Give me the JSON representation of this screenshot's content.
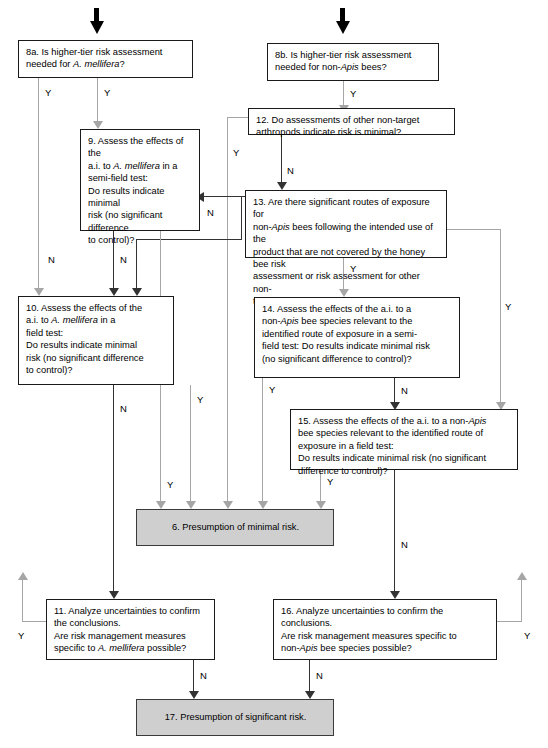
{
  "diagram": {
    "colors": {
      "box_border": "#1a1a1a",
      "box_fill": "#ffffff",
      "terminal_fill": "#cfcfcf",
      "connector_dark": "#333333",
      "connector_gray": "#a6a6a6",
      "entry_arrow": "#000000",
      "text": "#000000"
    },
    "edge_labels": {
      "yes": "Y",
      "no": "N"
    }
  },
  "nodes": {
    "n8a": {
      "id": "8a",
      "text_parts": [
        "8a. Is higher-tier risk assessment needed for ",
        "A. mellifera",
        "?"
      ],
      "plain": "8a. Is higher-tier risk assessment needed for A. mellifera?"
    },
    "n8b": {
      "id": "8b",
      "text_parts": [
        "8b. Is higher-tier risk assessment needed for non-",
        "Apis",
        " bees?"
      ],
      "plain": "8b. Is higher-tier risk assessment needed for non-Apis bees?"
    },
    "n9": {
      "id": "9",
      "text_parts": [
        "9. Assess the effects of the a.i. to ",
        "A. mellifera",
        " in a semi-field test: Do results indicate minimal risk (no significant difference to control)?"
      ],
      "plain": "9. Assess the effects of the a.i. to A. mellifera in a semi-field test: Do results indicate minimal risk (no significant difference to control)?"
    },
    "n10": {
      "id": "10",
      "text_parts": [
        "10. Assess the effects of the a.i. to ",
        "A. mellifera",
        " in a field test: Do results indicate minimal risk (no significant difference to control)?"
      ],
      "plain": "10. Assess the effects of the a.i. to A. mellifera in a field test: Do results indicate minimal risk (no significant difference to control)?"
    },
    "n11": {
      "id": "11",
      "text_parts": [
        "11. Analyze uncertainties to confirm the conclusions. Are risk management measures specific to ",
        "A. mellifera",
        " possible?"
      ],
      "plain": "11. Analyze uncertainties to confirm the conclusions. Are risk management measures specific to A. mellifera possible?"
    },
    "n12": {
      "id": "12",
      "plain": "12. Do assessments of other non-target arthropods indicate risk is minimal?"
    },
    "n13": {
      "id": "13",
      "text_parts": [
        "13. Are there significant routes of exposure for non-",
        "Apis",
        " bees following the intended use of the product that are not covered by the honey bee risk assessment or risk assessment for other non-target arthropods?"
      ],
      "plain": "13. Are there significant routes of exposure for non-Apis bees following the intended use of the product that are not covered by the honey bee risk assessment or risk assessment for other non-target arthropods?"
    },
    "n14": {
      "id": "14",
      "text_parts": [
        "14. Assess the effects of the a.i. to a non-",
        "Apis",
        " bee species relevant to the identified route of exposure in a semi-field test: Do results indicate minimal risk (no significant difference to control)?"
      ],
      "plain": "14. Assess the effects of the a.i. to a non-Apis bee species relevant to the identified route of exposure in a semi-field test: Do results indicate minimal risk (no significant difference to control)?"
    },
    "n15": {
      "id": "15",
      "text_parts": [
        "15. Assess the effects of the a.i. to a non-",
        "Apis",
        " bee species relevant to the identified route of exposure in a field test: Do results indicate minimal risk (no significant difference to control)?"
      ],
      "plain": "15. Assess the effects of the a.i. to a non-Apis bee species relevant to the identified route of exposure in a field test: Do results indicate minimal risk (no significant difference to control)?"
    },
    "n16": {
      "id": "16",
      "text_parts": [
        "16. Analyze uncertainties to confirm the conclusions. Are risk management measures specific to non-",
        "Apis",
        " bee species possible?"
      ],
      "plain": "16. Analyze uncertainties to confirm the conclusions. Are risk management measures specific to non-Apis bee species possible?"
    },
    "n6": {
      "id": "6",
      "plain": "6. Presumption of minimal risk."
    },
    "n17": {
      "id": "17",
      "plain": "17. Presumption of significant risk."
    }
  },
  "labels": {
    "y8a_left": "Y",
    "y8a_mid": "Y",
    "y8b": "Y",
    "n12": "N",
    "y12": "Y",
    "n9_a": "N",
    "n9_b": "N",
    "n13": "N",
    "y13_right": "Y",
    "y13_down": "Y",
    "n10": "N",
    "y10_right": "Y",
    "y14": "Y",
    "n14": "N",
    "y15": "Y",
    "n15": "N",
    "y6_right": "Y",
    "y6_mid": "Y",
    "n11": "N",
    "y11": "Y",
    "n16": "N",
    "y16": "Y"
  },
  "fragments": {
    "n9_l1": "9. Assess the effects of the",
    "n9_l2a": "a.i. to ",
    "n9_l2i": "A. mellifera",
    "n9_l2b": " in a",
    "n9_l3": "semi-field test:",
    "n9_l4": "Do results indicate minimal",
    "n9_l5": "risk (no significant difference",
    "n9_l6": "to control)?",
    "n10_l1": "10. Assess the effects of the",
    "n10_l2a": "a.i. to ",
    "n10_l2i": "A. mellifera",
    "n10_l2b": " in a",
    "n10_l3": "field test:",
    "n10_l4": "Do results indicate minimal",
    "n10_l5": "risk (no significant difference",
    "n10_l6": "to control)?",
    "n8a_l1": "8a. Is higher-tier risk assessment",
    "n8a_l2a": "needed for ",
    "n8a_l2i": "A. mellifera",
    "n8a_l2b": "?",
    "n8b_l1": "8b. Is higher-tier risk assessment",
    "n8b_l2a": "needed for non-",
    "n8b_l2i": "Apis",
    "n8b_l2b": " bees?",
    "n12_l1": "12. Do assessments of other non-target",
    "n12_l2": "arthropods indicate risk is minimal?",
    "n13_l1": "13. Are there significant routes of exposure for",
    "n13_l2a": "non-",
    "n13_l2i": "Apis",
    "n13_l2b": " bees following the intended use of the",
    "n13_l3": "product that are not covered by the honey bee risk",
    "n13_l4": "assessment or risk assessment for other non-",
    "n13_l5": "target arthropods?",
    "n14_l1": "14. Assess the effects of the a.i. to a",
    "n14_l2a": "non-",
    "n14_l2i": "Apis",
    "n14_l2b": " bee species relevant to the",
    "n14_l3": "identified route of exposure in a semi-",
    "n14_l4": "field test: Do results indicate minimal risk",
    "n14_l5": "(no significant difference to control)?",
    "n15_l1a": "15. Assess the effects of the a.i. to a non-",
    "n15_l1i": "Apis",
    "n15_l2": "bee species relevant to the identified route of",
    "n15_l3": "exposure in a field test:",
    "n15_l4": "Do results indicate minimal risk (no significant",
    "n15_l5": "difference to control)?",
    "n11_l1": "11. Analyze uncertainties to confirm",
    "n11_l2": "the conclusions.",
    "n11_l3": "Are risk management measures",
    "n11_l4a": "specific to ",
    "n11_l4i": "A. mellifera",
    "n11_l4b": " possible?",
    "n16_l1": "16. Analyze uncertainties to confirm the",
    "n16_l2": "conclusions.",
    "n16_l3": "Are risk management measures specific to",
    "n16_l4a": "non-",
    "n16_l4i": "Apis",
    "n16_l4b": " bee species possible?",
    "n6_text": "6. Presumption of minimal risk.",
    "n17_text": "17. Presumption of significant risk."
  }
}
